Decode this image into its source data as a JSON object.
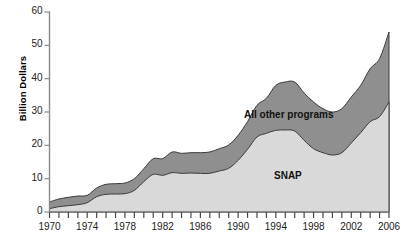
{
  "axes": {
    "ylabel": "Billion Dollars",
    "y_ticks": [
      "0",
      "10",
      "20",
      "30",
      "40",
      "50",
      "60"
    ],
    "x_ticks": [
      "1970",
      "1974",
      "1978",
      "1982",
      "1986",
      "1990",
      "1994",
      "1998",
      "2002",
      "2006"
    ]
  },
  "labels": {
    "all_other": "All other programs",
    "snap": "SNAP"
  },
  "colors": {
    "snap_fill": "#d9d9d9",
    "other_fill": "#8f8f8f",
    "outline": "#3a3a3a",
    "axis": "#8a8a8a",
    "text": "#222222"
  },
  "chart_data": {
    "type": "area",
    "title": "",
    "xlabel": "",
    "ylabel": "Billion Dollars",
    "xlim": [
      1970,
      2006
    ],
    "ylim": [
      0,
      60
    ],
    "yticks": [
      0,
      10,
      20,
      30,
      40,
      50,
      60
    ],
    "xticks": [
      1970,
      1974,
      1978,
      1982,
      1986,
      1990,
      1994,
      1998,
      2002,
      2006
    ],
    "grid": false,
    "legend": "inline-labels",
    "stacked": true,
    "x": [
      1970,
      1971,
      1972,
      1973,
      1974,
      1975,
      1976,
      1977,
      1978,
      1979,
      1980,
      1981,
      1982,
      1983,
      1984,
      1985,
      1986,
      1987,
      1988,
      1989,
      1990,
      1991,
      1992,
      1993,
      1994,
      1995,
      1996,
      1997,
      1998,
      1999,
      2000,
      2001,
      2002,
      2003,
      2004,
      2005,
      2006
    ],
    "series": [
      {
        "name": "SNAP",
        "values": [
          1.0,
          1.6,
          1.9,
          2.2,
          2.8,
          4.6,
          5.3,
          5.4,
          5.5,
          6.5,
          9.1,
          11.3,
          11.0,
          11.8,
          11.6,
          11.7,
          11.6,
          11.6,
          12.3,
          13.1,
          15.5,
          18.8,
          22.5,
          23.6,
          24.5,
          24.6,
          24.3,
          21.5,
          19.0,
          17.8,
          17.1,
          17.8,
          20.7,
          23.8,
          27.1,
          28.6,
          33.0
        ]
      },
      {
        "name": "All other programs",
        "values": [
          2.0,
          2.3,
          2.5,
          2.6,
          2.2,
          2.6,
          3.0,
          3.1,
          3.2,
          3.5,
          3.9,
          4.7,
          5.0,
          6.2,
          6.0,
          6.1,
          6.2,
          6.4,
          6.7,
          7.0,
          7.5,
          8.3,
          9.5,
          10.5,
          13.5,
          14.4,
          14.7,
          14.2,
          14.0,
          13.2,
          12.9,
          13.2,
          13.8,
          14.2,
          15.9,
          17.4,
          21.0
        ]
      }
    ],
    "totals": [
      3.0,
      3.9,
      4.4,
      4.8,
      5.0,
      7.2,
      8.3,
      8.5,
      8.7,
      10.0,
      13.0,
      16.0,
      16.0,
      18.0,
      17.6,
      17.8,
      17.8,
      18.0,
      19.0,
      20.1,
      23.0,
      27.1,
      32.0,
      34.1,
      38.0,
      39.0,
      39.0,
      35.7,
      33.0,
      31.0,
      30.0,
      31.0,
      34.5,
      38.0,
      43.0,
      46.0,
      54.0
    ]
  }
}
